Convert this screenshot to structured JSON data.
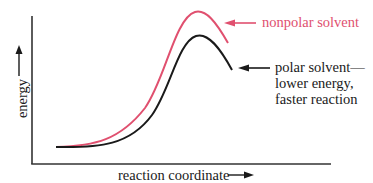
{
  "diagram": {
    "type": "reaction-energy-diagram",
    "y_axis_label": "energy",
    "x_axis_label": "reaction coordinate",
    "colors": {
      "nonpolar": "#e0506f",
      "polar": "#1a1a1a",
      "axis": "#333333"
    },
    "curves": [
      {
        "name": "nonpolar solvent",
        "color": "#e0506f",
        "relative_peak": "higher"
      },
      {
        "name": "polar solvent",
        "color": "#1a1a1a",
        "relative_peak": "lower"
      }
    ],
    "annotations": {
      "nonpolar": "nonpolar solvent",
      "polar_line1": "polar solvent—",
      "polar_line2": "lower energy,",
      "polar_line3": "faster reaction"
    }
  }
}
